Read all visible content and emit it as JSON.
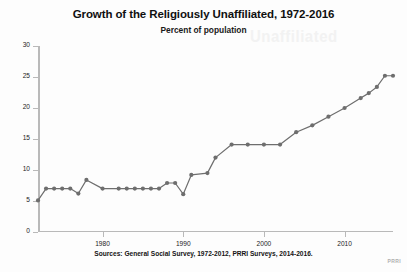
{
  "chart_data": {
    "type": "line",
    "title": "Growth of the Religiously Unaffiliated, 1972-2016",
    "subtitle": "Percent of population",
    "xlabel": "",
    "ylabel": "",
    "ylim": [
      0,
      30
    ],
    "xlim": [
      1972,
      2016
    ],
    "grid": false,
    "legend": null,
    "y_ticks": [
      0,
      5,
      10,
      15,
      20,
      25,
      30
    ],
    "x_ticks": [
      1980,
      1990,
      2000,
      2010
    ],
    "marker": "circle",
    "series_color": "#6e6e6e",
    "source_note": "Sources: General Social Survey, 1972-2012, PRRI Surveys, 2014-2016.",
    "watermark": "PRRI",
    "series": [
      {
        "name": "Religiously unaffiliated",
        "x": [
          1972,
          1973,
          1974,
          1975,
          1976,
          1977,
          1978,
          1980,
          1982,
          1983,
          1984,
          1985,
          1986,
          1987,
          1988,
          1989,
          1990,
          1991,
          1993,
          1994,
          1996,
          1998,
          2000,
          2002,
          2004,
          2006,
          2008,
          2010,
          2012,
          2013,
          2014,
          2015,
          2016
        ],
        "values": [
          5.1,
          7.0,
          7.0,
          7.0,
          7.0,
          6.2,
          8.4,
          7.0,
          7.0,
          7.0,
          7.0,
          7.0,
          7.0,
          7.0,
          7.9,
          7.9,
          6.1,
          9.2,
          9.5,
          12.0,
          14.1,
          14.1,
          14.1,
          14.1,
          16.1,
          17.2,
          18.6,
          20.0,
          21.6,
          22.4,
          23.4,
          25.2,
          25.2
        ]
      }
    ]
  },
  "ghost_text": "Unaffiliated",
  "axis": {
    "y_labels": [
      "30",
      "25",
      "20",
      "15",
      "10",
      "5",
      "0"
    ],
    "x_labels": [
      "1980",
      "1990",
      "2000",
      "2010"
    ]
  }
}
